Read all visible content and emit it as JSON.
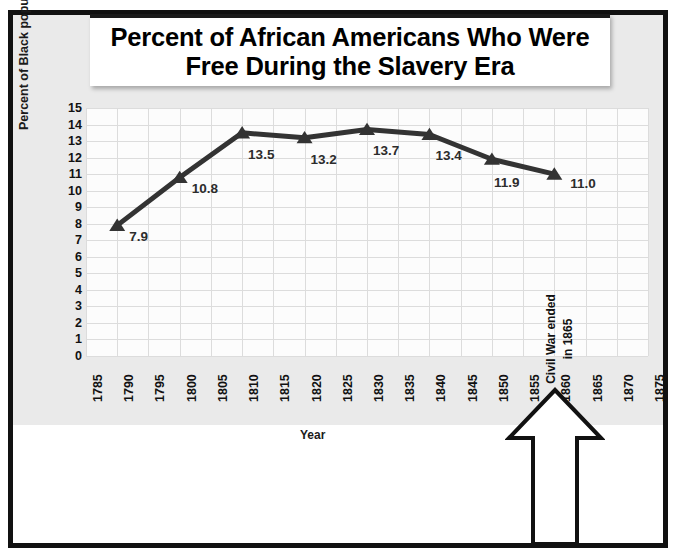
{
  "chart_data": {
    "type": "line",
    "title": "Percent of African Americans Who Were Free During the Slavery Era",
    "title_line1": "Percent of African Americans Who Were",
    "title_line2": "Free During the Slavery Era",
    "xlabel": "Year",
    "ylabel": "Percent of Black population",
    "x": [
      1790,
      1800,
      1810,
      1820,
      1830,
      1840,
      1850,
      1860
    ],
    "values": [
      7.9,
      10.8,
      13.5,
      13.2,
      13.7,
      13.4,
      11.9,
      11.0
    ],
    "point_labels": [
      "7.9",
      "10.8",
      "13.5",
      "13.2",
      "13.7",
      "13.4",
      "11.9",
      "11.0"
    ],
    "xlim": [
      1785,
      1875
    ],
    "ylim": [
      0,
      15
    ],
    "x_ticks": [
      "1785",
      "1790",
      "1795",
      "1800",
      "1805",
      "1810",
      "1815",
      "1820",
      "1825",
      "1830",
      "1835",
      "1840",
      "1845",
      "1850",
      "1855",
      "1860",
      "1865",
      "1870",
      "1875"
    ],
    "y_ticks": [
      "15",
      "14",
      "13",
      "12",
      "11",
      "10",
      "9",
      "8",
      "7",
      "6",
      "5",
      "4",
      "3",
      "2",
      "1",
      "0"
    ],
    "grid": true,
    "legend": "none",
    "marker": "triangle",
    "series_color": "#333333",
    "annotations": [
      {
        "name": "civil-war-arrow",
        "text_line1": "Civil War ended",
        "text_line2": "in 1865",
        "points_to": "1865",
        "shape": "up-arrow"
      }
    ]
  },
  "colors": {
    "background": "#ffffff",
    "canvas": "#eaeaea",
    "border": "#111111",
    "grid": "#dcdcdc",
    "line": "#333333",
    "text": "#111111"
  }
}
